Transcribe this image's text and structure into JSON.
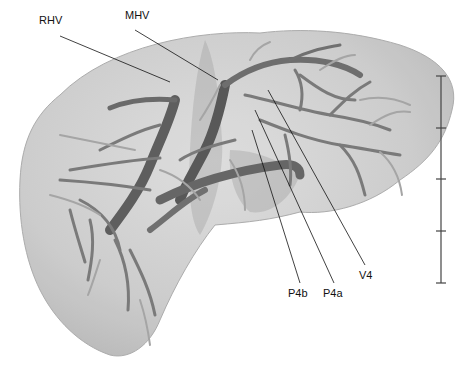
{
  "figure": {
    "colors": {
      "background": "#ffffff",
      "liver_surface": "#c9c9c9",
      "liver_edge": "#a8a8a8",
      "vessel_dark": "#5a5a5a",
      "vessel_mid": "#8a8a8a",
      "vessel_light": "#b0b0b0",
      "leader_line": "#111111"
    },
    "labels": [
      {
        "id": "rhv",
        "text": "RHV",
        "x": 39,
        "y": 20
      },
      {
        "id": "mhv",
        "text": "MHV",
        "x": 125,
        "y": 15
      },
      {
        "id": "p4b",
        "text": "P4b",
        "x": 293,
        "y": 287
      },
      {
        "id": "p4a",
        "text": "P4a",
        "x": 327,
        "y": 287
      },
      {
        "id": "v4",
        "text": "V4",
        "x": 360,
        "y": 270
      }
    ],
    "scale_bar": {
      "x": 441,
      "y_top": 76,
      "y_bottom": 283,
      "ticks": 5,
      "segments": 4
    }
  }
}
